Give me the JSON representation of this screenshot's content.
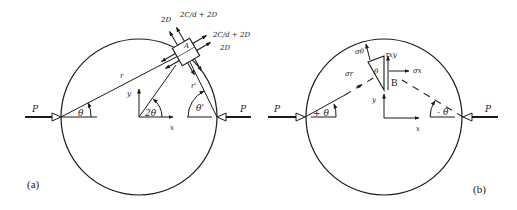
{
  "figure": {
    "panel_a": {
      "label": "(a)",
      "load_left": "P",
      "load_right": "P",
      "radius_label": "r",
      "radius_prime_label": "r'",
      "angle_left": "θ",
      "angle_right": "θ'",
      "center_angle": "2θ",
      "axis_x": "x",
      "axis_y": "y",
      "element_label": "A",
      "stress_labels": {
        "top_left": "2D",
        "top_right": "2C/d + 2D",
        "right_upper": "2C/d + 2D",
        "right_lower": "2D"
      }
    },
    "panel_b": {
      "label": "(b)",
      "load_left": "P",
      "load_right": "P",
      "angle_left": "+ θ",
      "angle_right": "- θ",
      "wedge_angle": "θ",
      "axis_x": "x",
      "axis_y": "y",
      "element_label": "B",
      "stress_labels": {
        "sigma_theta": "σθ",
        "sigma_r": "σr",
        "tau_xy": "τxy",
        "sigma_x": "σx"
      }
    }
  }
}
